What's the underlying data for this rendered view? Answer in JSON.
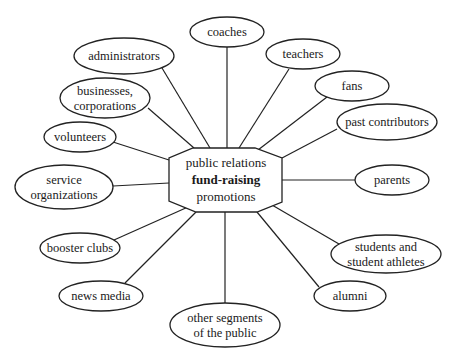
{
  "diagram": {
    "type": "hub-and-spoke",
    "center": {
      "lines": [
        "public relations",
        "fund-raising",
        "promotions"
      ],
      "bold_line_index": 1,
      "shape": "octagon"
    },
    "nodes": [
      {
        "id": "coaches",
        "lines": [
          "coaches"
        ],
        "cx": 227,
        "cy": 32,
        "rx": 37,
        "ry": 15,
        "anchor": [
          227,
          148
        ]
      },
      {
        "id": "teachers",
        "lines": [
          "teachers"
        ],
        "cx": 303,
        "cy": 54,
        "rx": 37,
        "ry": 15,
        "anchor": [
          239,
          148
        ]
      },
      {
        "id": "fans",
        "lines": [
          "fans"
        ],
        "cx": 352,
        "cy": 86,
        "rx": 37,
        "ry": 15,
        "anchor": [
          258,
          150
        ]
      },
      {
        "id": "past-contributors",
        "lines": [
          "past contributors"
        ],
        "cx": 387,
        "cy": 122,
        "rx": 50,
        "ry": 18,
        "anchor": [
          282,
          158
        ]
      },
      {
        "id": "parents",
        "lines": [
          "parents"
        ],
        "cx": 392,
        "cy": 180,
        "rx": 37,
        "ry": 15,
        "anchor": [
          282,
          180
        ]
      },
      {
        "id": "students",
        "lines": [
          "students and",
          "student athletes"
        ],
        "cx": 386,
        "cy": 254,
        "rx": 55,
        "ry": 19,
        "anchor": [
          272,
          205
        ]
      },
      {
        "id": "alumni",
        "lines": [
          "alumni"
        ],
        "cx": 350,
        "cy": 296,
        "rx": 36,
        "ry": 15,
        "anchor": [
          257,
          212
        ]
      },
      {
        "id": "other-segments",
        "lines": [
          "other segments",
          "of the public"
        ],
        "cx": 225,
        "cy": 325,
        "rx": 55,
        "ry": 22,
        "anchor": [
          225,
          212
        ]
      },
      {
        "id": "news-media",
        "lines": [
          "news media"
        ],
        "cx": 101,
        "cy": 296,
        "rx": 42,
        "ry": 15,
        "anchor": [
          196,
          212
        ]
      },
      {
        "id": "booster-clubs",
        "lines": [
          "booster clubs"
        ],
        "cx": 80,
        "cy": 248,
        "rx": 40,
        "ry": 15,
        "anchor": [
          188,
          207
        ]
      },
      {
        "id": "service-organizations",
        "lines": [
          "service",
          "organizations"
        ],
        "cx": 64,
        "cy": 187,
        "rx": 49,
        "ry": 22,
        "anchor": [
          169,
          183
        ]
      },
      {
        "id": "volunteers",
        "lines": [
          "volunteers"
        ],
        "cx": 80,
        "cy": 137,
        "rx": 36,
        "ry": 15,
        "anchor": [
          169,
          160
        ]
      },
      {
        "id": "businesses-corporations",
        "lines": [
          "businesses,",
          "corporations"
        ],
        "cx": 105,
        "cy": 98,
        "rx": 45,
        "ry": 20,
        "anchor": [
          194,
          148
        ]
      },
      {
        "id": "administrators",
        "lines": [
          "administrators"
        ],
        "cx": 124,
        "cy": 56,
        "rx": 50,
        "ry": 18,
        "anchor": [
          210,
          148
        ]
      }
    ],
    "edge_starts": {
      "coaches": [
        227,
        47
      ],
      "teachers": [
        289,
        69
      ],
      "fans": [
        327,
        97
      ],
      "past-contributors": [
        337,
        129
      ],
      "parents": [
        355,
        180
      ],
      "students": [
        339,
        244
      ],
      "alumni": [
        319,
        287
      ],
      "other-segments": [
        225,
        303
      ],
      "news-media": [
        125,
        283
      ],
      "booster-clubs": [
        114,
        240
      ],
      "service-organizations": [
        113,
        186
      ],
      "volunteers": [
        113,
        142
      ],
      "businesses-corporations": [
        148,
        108
      ],
      "administrators": [
        162,
        68
      ]
    }
  }
}
